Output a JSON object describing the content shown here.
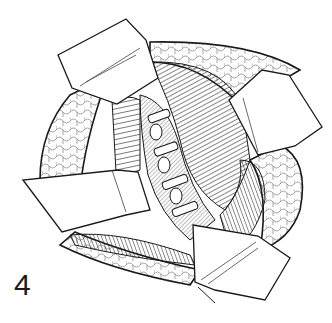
{
  "figure": {
    "label": "4",
    "colors": {
      "background": "#ffffff",
      "ink": "#1a1a1a",
      "hatch": "#333333",
      "fat_line": "#555555"
    },
    "retractors": [
      {
        "name": "upper-left"
      },
      {
        "name": "right"
      },
      {
        "name": "left"
      },
      {
        "name": "lower-right"
      }
    ]
  }
}
